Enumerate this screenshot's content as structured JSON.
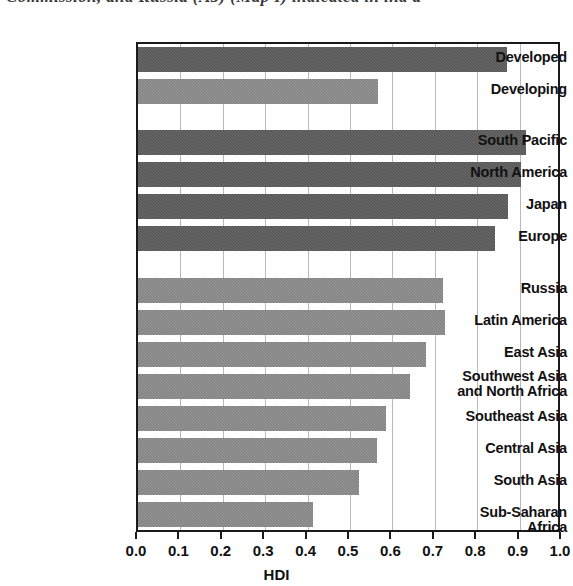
{
  "page": {
    "cropped_caption_fragment": "Commission, and Russia (A5) (Map I) indicated in ind a"
  },
  "chart_data": {
    "type": "bar",
    "orientation": "horizontal",
    "title": "",
    "xlabel": "HDI",
    "ylabel": "",
    "xlim": [
      0.0,
      1.0
    ],
    "grid": true,
    "grid_axis": "x",
    "legend": "none",
    "tick_labels": [
      "0.0",
      "0.1",
      "0.2",
      "0.3",
      "0.4",
      "0.5",
      "0.6",
      "0.7",
      "0.8",
      "0.9",
      "1.0"
    ],
    "tick_values": [
      0.0,
      0.1,
      0.2,
      0.3,
      0.4,
      0.5,
      0.6,
      0.7,
      0.8,
      0.9,
      1.0
    ],
    "colors": {
      "dark": "#6e6e6e",
      "light": "#9a9a9a",
      "axis": "#1a1a1a",
      "gridline": "#b9b9b9"
    },
    "groups": [
      {
        "name": "summary",
        "categories": [
          "Developed",
          "Developing"
        ],
        "values": [
          0.87,
          0.565
        ]
      },
      {
        "name": "high-hdi-regions",
        "categories": [
          "South Pacific",
          "North America",
          "Japan",
          "Europe"
        ],
        "values": [
          0.915,
          0.903,
          0.873,
          0.842
        ]
      },
      {
        "name": "other-regions",
        "categories": [
          "Russia",
          "Latin America",
          "East Asia",
          "Southwest Asia and North Africa",
          "Southeast Asia",
          "Central Asia",
          "South Asia",
          "Sub-Saharan Africa"
        ],
        "values": [
          0.719,
          0.724,
          0.679,
          0.642,
          0.585,
          0.564,
          0.521,
          0.413
        ]
      }
    ],
    "categories": [
      "Developed",
      "Developing",
      "South Pacific",
      "North America",
      "Japan",
      "Europe",
      "Russia",
      "Latin America",
      "East Asia",
      "Southwest Asia and North Africa",
      "Southeast Asia",
      "Central Asia",
      "South Asia",
      "Sub-Saharan Africa"
    ],
    "values": [
      0.87,
      0.565,
      0.915,
      0.903,
      0.873,
      0.842,
      0.719,
      0.724,
      0.679,
      0.642,
      0.585,
      0.564,
      0.521,
      0.413
    ],
    "bars": [
      {
        "label": "Developed",
        "label_lines": [
          "Developed"
        ],
        "value": 0.87,
        "shade": "dark",
        "y": 45
      },
      {
        "label": "Developing",
        "label_lines": [
          "Developing"
        ],
        "value": 0.565,
        "shade": "light",
        "y": 77
      },
      {
        "label": "South Pacific",
        "label_lines": [
          "South Pacific"
        ],
        "value": 0.915,
        "shade": "dark",
        "y": 128
      },
      {
        "label": "North America",
        "label_lines": [
          "North America"
        ],
        "value": 0.903,
        "shade": "dark",
        "y": 160
      },
      {
        "label": "Japan",
        "label_lines": [
          "Japan"
        ],
        "value": 0.873,
        "shade": "dark",
        "y": 192
      },
      {
        "label": "Europe",
        "label_lines": [
          "Europe"
        ],
        "value": 0.842,
        "shade": "dark",
        "y": 224
      },
      {
        "label": "Russia",
        "label_lines": [
          "Russia"
        ],
        "value": 0.719,
        "shade": "light",
        "y": 276
      },
      {
        "label": "Latin America",
        "label_lines": [
          "Latin America"
        ],
        "value": 0.724,
        "shade": "light",
        "y": 308
      },
      {
        "label": "East Asia",
        "label_lines": [
          "East Asia"
        ],
        "value": 0.679,
        "shade": "light",
        "y": 340
      },
      {
        "label": "Southwest Asia and North Africa",
        "label_lines": [
          "Southwest Asia",
          "and North Africa"
        ],
        "value": 0.642,
        "shade": "light",
        "y": 372
      },
      {
        "label": "Southeast Asia",
        "label_lines": [
          "Southeast Asia"
        ],
        "value": 0.585,
        "shade": "light",
        "y": 404
      },
      {
        "label": "Central Asia",
        "label_lines": [
          "Central Asia"
        ],
        "value": 0.564,
        "shade": "light",
        "y": 436
      },
      {
        "label": "South Asia",
        "label_lines": [
          "South Asia"
        ],
        "value": 0.521,
        "shade": "light",
        "y": 468
      },
      {
        "label": "Sub-Saharan Africa",
        "label_lines": [
          "Sub-Saharan Africa"
        ],
        "value": 0.413,
        "shade": "light",
        "y": 500
      }
    ]
  }
}
